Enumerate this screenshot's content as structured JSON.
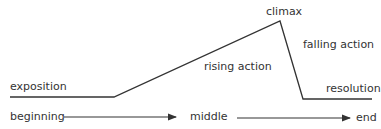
{
  "diagram": {
    "type": "plot-structure",
    "labels": {
      "exposition": "exposition",
      "rising_action": "rising action",
      "climax": "climax",
      "falling_action": "falling action",
      "resolution": "resolution",
      "beginning": "beginning",
      "middle": "middle",
      "end": "end"
    },
    "line_color": "#333333"
  }
}
